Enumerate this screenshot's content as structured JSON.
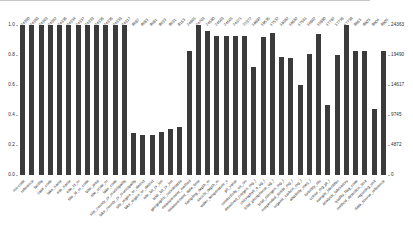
{
  "chart_data": {
    "type": "bar",
    "title": "",
    "subtitle": "",
    "xlabel": "",
    "ylabel": "",
    "ylabel_right": "",
    "grid": false,
    "legend": "none",
    "bar_color": "#3b3b3b",
    "background_color": "#ffffff",
    "label_rotation_deg": -45,
    "ylim": [
      0,
      1.0
    ],
    "ylim_right": [
      0,
      24363
    ],
    "yticks_left": [
      "0.0",
      "0.2",
      "0.4",
      "0.6",
      "0.8",
      "1.0"
    ],
    "yticks_left_values": [
      0.0,
      0.2,
      0.4,
      0.6,
      0.8,
      1.0
    ],
    "yticks_right": [
      "0",
      "4872",
      "9745",
      "14617",
      "19490",
      "24363"
    ],
    "yticks_right_values": [
      0,
      4872,
      9745,
      14617,
      19490,
      24363
    ],
    "categories": [
      "24360",
      "24383",
      "24363",
      "24362",
      "24336",
      "24334",
      "24337",
      "24333",
      "24336",
      "24336",
      "24333",
      "24317",
      "9682",
      "9683",
      "9681",
      "9633",
      "9631",
      "9163",
      "24801",
      "24703",
      "24580",
      "24503",
      "24501",
      "24371",
      "22372",
      "19892",
      "19535",
      "17532",
      "19382",
      "18682",
      "17561",
      "16802",
      "15880",
      "17782",
      "17736",
      "17738",
      "9863",
      "9803",
      "9804",
      "9805"
    ],
    "categories_bottom": [
      "ms-code",
      "reference",
      "facility",
      "case_code",
      "lake_name",
      "site_name",
      "site_id_nr",
      "site_id_or_code",
      "lake_area",
      "site_code_nr",
      "lake_code",
      "site_county_or_municipality",
      "lake_county_or_municipality",
      "site_region_or_district",
      "lake_region_or_district",
      "site_lat_or_lon",
      "lake_lat_or_lon",
      "geographic_coordinates",
      "measurement_method",
      "measurement_date_time",
      "sampling_depth_m",
      "secchi_depth_m",
      "water_temperature_c",
      "ph_value",
      "conductivity_us_cm",
      "dissolved_oxygen_mg_l",
      "chlorophyll_a_ug_l",
      "total_phosphorus_ug_l",
      "total_nitrogen_mg_l",
      "suspended_solids_mg_l",
      "organic_carbon_mg_l",
      "alkalinity_meq_l",
      "turbidity_ntu",
      "colour_mg_pt_l",
      "sample_identifier",
      "analysis_laboratory",
      "quality_flag_code",
      "method_detection_limit",
      "reporting_unit",
      "data_source_reference"
    ],
    "values": [
      1.0,
      1.0,
      1.0,
      1.0,
      1.0,
      1.0,
      1.0,
      1.0,
      1.0,
      1.0,
      1.0,
      1.0,
      0.28,
      0.27,
      0.27,
      0.29,
      0.31,
      0.32,
      0.83,
      1.0,
      0.96,
      0.93,
      0.93,
      0.93,
      0.93,
      0.72,
      0.92,
      0.95,
      0.79,
      0.78,
      0.6,
      0.81,
      0.94,
      0.47,
      0.8,
      1.0,
      0.83,
      0.83,
      0.44,
      0.83
    ],
    "values_right_scale": [
      24363,
      24363,
      24363,
      24363,
      24363,
      24363,
      24363,
      24363,
      24363,
      24363,
      24363,
      24363,
      6822,
      6578,
      6578,
      7066,
      7553,
      7797,
      20221,
      24363,
      23388,
      22658,
      22658,
      22658,
      22658,
      17541,
      22414,
      23145,
      19247,
      19003,
      14618,
      19734,
      22901,
      11451,
      19490,
      24363,
      20221,
      20221,
      10720,
      20221
    ],
    "bar_count": 40
  },
  "caption": {
    "text": ""
  }
}
